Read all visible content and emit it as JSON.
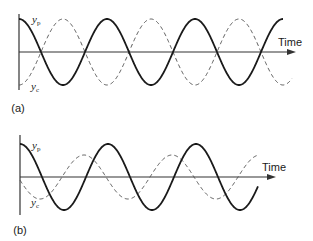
{
  "panels": [
    {
      "id": "a",
      "label": "(a)",
      "axis_label": "Time",
      "solid_label": "y",
      "solid_sub": "p",
      "dashed_label": "y",
      "dashed_sub": "c",
      "origin": [
        19,
        52
      ],
      "axis_top": 14,
      "axis_bottom": 90,
      "axis_end": 296,
      "period": 88,
      "solid": {
        "amplitude": 33,
        "phase_x": 19,
        "x_end": 283,
        "sign": -1
      },
      "dashed": {
        "amplitude": 33,
        "phase_x": 19,
        "x_end": 292,
        "sign": 1
      },
      "label_pos": {
        "panel": [
          18,
          112
        ],
        "time": [
          278,
          46
        ],
        "solid": [
          32,
          23
        ],
        "dashed": [
          31,
          90
        ]
      }
    },
    {
      "id": "b",
      "label": "(b)",
      "axis_label": "Time",
      "solid_label": "y",
      "solid_sub": "p",
      "dashed_label": "y",
      "dashed_sub": "c",
      "origin": [
        20,
        177
      ],
      "axis_top": 135,
      "axis_bottom": 215,
      "axis_end": 276,
      "period": 88,
      "solid": {
        "amplitude": 33,
        "phase_x": 20,
        "x_end": 258,
        "sign": -1
      },
      "dashed": {
        "amplitude": 22,
        "phase_x": 40,
        "x_end": 258,
        "sign": 1
      },
      "label_pos": {
        "panel": [
          20,
          234
        ],
        "time": [
          262,
          171
        ],
        "solid": [
          32,
          149
        ],
        "dashed": [
          31,
          206
        ]
      }
    }
  ],
  "colors": {
    "line": "#1a1a1a",
    "axis": "#333333",
    "dashed": "#555555"
  }
}
